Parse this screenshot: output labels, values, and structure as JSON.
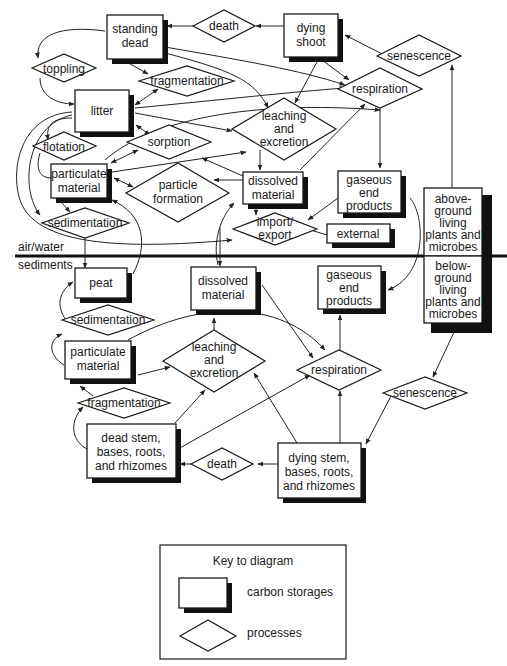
{
  "diagram": {
    "zones": {
      "upper": "air/water",
      "lower": "sediments"
    },
    "storages": {
      "standing_dead": [
        "standing",
        "dead"
      ],
      "dying_shoot": [
        "dying",
        "shoot"
      ],
      "litter": [
        "litter"
      ],
      "particulate_upper": [
        "particulate",
        "material"
      ],
      "dissolved_upper": [
        "dissolved",
        "material"
      ],
      "gaseous_upper": [
        "gaseous",
        "end",
        "products"
      ],
      "external": [
        "external"
      ],
      "above_ground": [
        "above-",
        "ground",
        "living",
        "plants and",
        "microbes"
      ],
      "below_ground": [
        "below-",
        "ground",
        "living",
        "plants and",
        "microbes"
      ],
      "peat": [
        "peat"
      ],
      "dissolved_lower": [
        "dissolved",
        "material"
      ],
      "gaseous_lower": [
        "gaseous",
        "end",
        "products"
      ],
      "particulate_lower": [
        "particulate",
        "material"
      ],
      "dead_stem": [
        "dead stem,",
        "bases, roots,",
        "and rhizomes"
      ],
      "dying_stem": [
        "dying stem,",
        "bases, roots,",
        "and rhizomes"
      ]
    },
    "processes": {
      "death_upper": [
        "death"
      ],
      "toppling": [
        "toppling"
      ],
      "fragmentation_upper": [
        "fragmentation"
      ],
      "respiration_upper": [
        "respiration"
      ],
      "senescence_upper": [
        "senescence"
      ],
      "leaching_upper": [
        "leaching",
        "and",
        "excretion"
      ],
      "flotation": [
        "flotation"
      ],
      "sorption": [
        "sorption"
      ],
      "particle_formation": [
        "particle",
        "formation"
      ],
      "sedimentation_upper": [
        "sedimentation"
      ],
      "import_export": [
        "import/",
        "export"
      ],
      "sedimentation_lower": [
        "sedimentation"
      ],
      "leaching_lower": [
        "leaching",
        "and",
        "excretion"
      ],
      "respiration_lower": [
        "respiration"
      ],
      "fragmentation_lower": [
        "fragmentation"
      ],
      "senescence_lower": [
        "senescence"
      ],
      "death_lower": [
        "death"
      ]
    }
  },
  "key": {
    "title": "Key to diagram",
    "storage_label": "carbon storages",
    "process_label": "processes"
  }
}
